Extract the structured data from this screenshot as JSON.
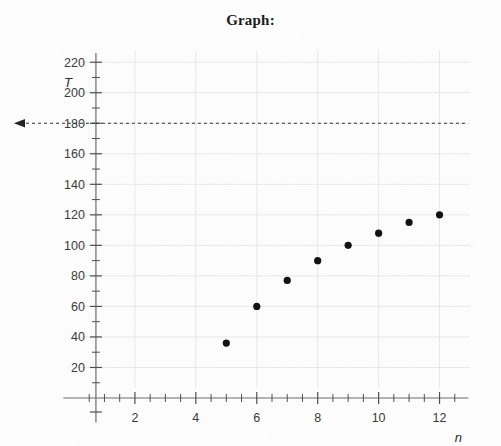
{
  "title": "Graph:",
  "axes": {
    "y_name": "T",
    "x_name": "n",
    "y_ticks": [
      "20",
      "40",
      "60",
      "80",
      "100",
      "120",
      "140",
      "160",
      "180",
      "200",
      "220"
    ],
    "x_ticks": [
      "2",
      "4",
      "6",
      "8",
      "10",
      "12"
    ]
  },
  "annotation": {
    "threshold_label": "180",
    "arrow_icon": "left-arrow-icon"
  },
  "chart_data": {
    "type": "scatter",
    "title": "Graph:",
    "xlabel": "n",
    "ylabel": "T",
    "grid": true,
    "legend": null,
    "xlim": [
      0,
      13
    ],
    "ylim": [
      0,
      228
    ],
    "x_major_step": 2,
    "x_minor_step": 0.5,
    "y_major_step": 20,
    "y_minor_step": 10,
    "x": [
      5,
      6,
      7,
      8,
      9,
      10,
      11,
      12
    ],
    "y": [
      36,
      60,
      77,
      90,
      100,
      108,
      115,
      120
    ],
    "points": [
      {
        "n": 5,
        "T": 36
      },
      {
        "n": 6,
        "T": 60
      },
      {
        "n": 7,
        "T": 77
      },
      {
        "n": 8,
        "T": 90
      },
      {
        "n": 9,
        "T": 100
      },
      {
        "n": 10,
        "T": 108
      },
      {
        "n": 11,
        "T": 115
      },
      {
        "n": 12,
        "T": 120
      }
    ],
    "annotations": [
      {
        "type": "hline",
        "value": 180,
        "label": "180",
        "style": "dashed",
        "arrow": "left"
      }
    ],
    "colors": {
      "marker": "#111111",
      "grid": "#e9e9e9",
      "axis": "#6d6d6d",
      "annotation": "#333333"
    }
  }
}
